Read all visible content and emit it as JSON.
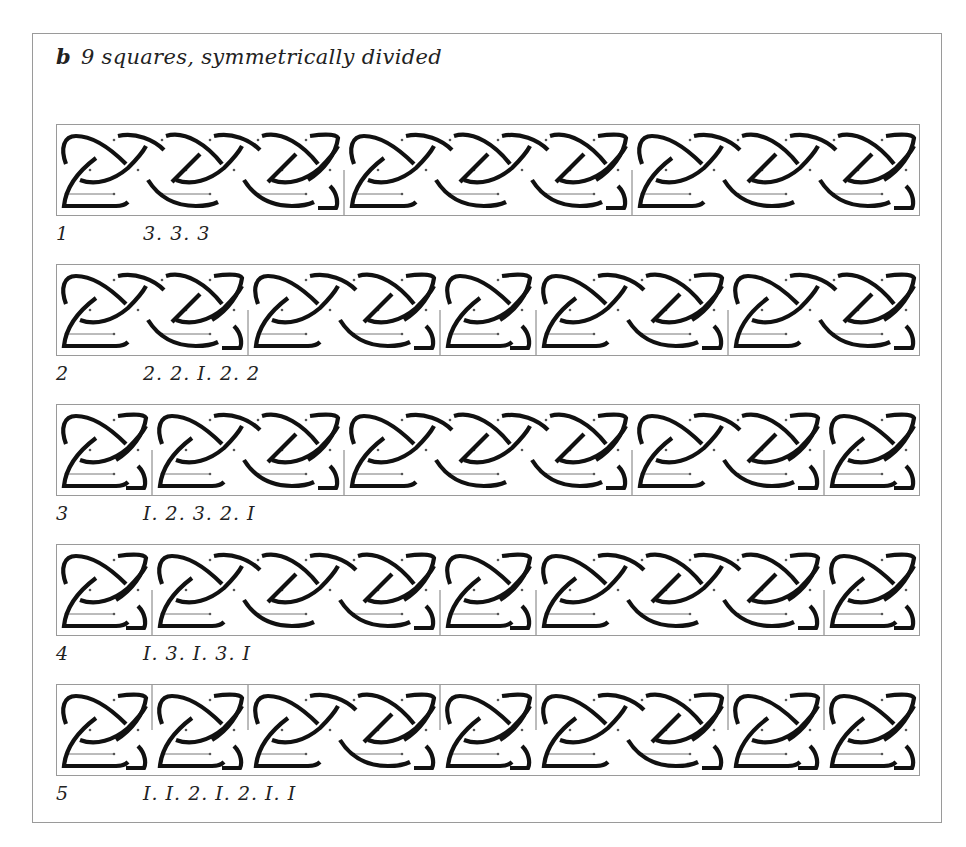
{
  "title": {
    "letter": "b",
    "text": "9 squares, symmetrically divided"
  },
  "figure": {
    "units_per_band": 9,
    "stroke_color": "#111111",
    "frame_color": "#9a9a9a",
    "guide_color": "#555555"
  },
  "rows": [
    {
      "number": "1",
      "code": "3. 3. 3",
      "groups": [
        3,
        3,
        3
      ],
      "divider_from": "bottom"
    },
    {
      "number": "2",
      "code": "2. 2. I. 2. 2",
      "groups": [
        2,
        2,
        1,
        2,
        2
      ],
      "divider_from": "bottom"
    },
    {
      "number": "3",
      "code": "I. 2. 3. 2. I",
      "groups": [
        1,
        2,
        3,
        2,
        1
      ],
      "divider_from": "bottom"
    },
    {
      "number": "4",
      "code": "I. 3. I. 3. I",
      "groups": [
        1,
        3,
        1,
        3,
        1
      ],
      "divider_from": "bottom"
    },
    {
      "number": "5",
      "code": "I. I. 2. I. 2. I. I",
      "groups": [
        1,
        1,
        2,
        1,
        2,
        1,
        1
      ],
      "divider_from": "top"
    }
  ]
}
